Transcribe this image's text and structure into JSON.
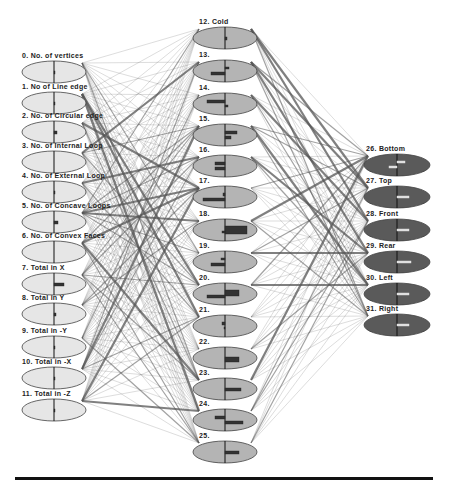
{
  "diagram": {
    "type": "neural-network",
    "colors": {
      "input_fill": "#e6e6e6",
      "hidden_fill": "#b4b4b4",
      "output_fill": "#5a5a5a",
      "node_stroke": "#444444",
      "edge": "#555555",
      "rule": "#111111"
    },
    "input_layer": [
      {
        "id": 0,
        "label": "0. No. of vertices",
        "cx": 54,
        "cy": 72,
        "bars": [
          {
            "w": 1,
            "h": 3,
            "dir": 1
          }
        ]
      },
      {
        "id": 1,
        "label": "1. No of Line edge",
        "cx": 54,
        "cy": 103,
        "bars": [
          {
            "w": 1,
            "h": 3,
            "dir": 1
          }
        ]
      },
      {
        "id": 2,
        "label": "2. No. of Circular edge",
        "cx": 54,
        "cy": 132,
        "bars": [
          {
            "w": 3,
            "h": 3,
            "dir": 1
          }
        ]
      },
      {
        "id": 3,
        "label": "3. No. of Internal Loop",
        "cx": 54,
        "cy": 162,
        "bars": []
      },
      {
        "id": 4,
        "label": "4. No. of External Loop",
        "cx": 54,
        "cy": 192,
        "bars": [
          {
            "w": 1,
            "h": 3,
            "dir": 1
          }
        ]
      },
      {
        "id": 5,
        "label": "5. No. of Concave Loops",
        "cx": 54,
        "cy": 222,
        "bars": [
          {
            "w": 4,
            "h": 3,
            "dir": 1
          }
        ]
      },
      {
        "id": 6,
        "label": "6. No. of Convex Faces",
        "cx": 54,
        "cy": 252,
        "bars": []
      },
      {
        "id": 7,
        "label": "7. Total in X",
        "cx": 54,
        "cy": 284,
        "bars": [
          {
            "w": 10,
            "h": 3,
            "dir": 1
          }
        ]
      },
      {
        "id": 8,
        "label": "8. Total in Y",
        "cx": 54,
        "cy": 314,
        "bars": [
          {
            "w": 2,
            "h": 3,
            "dir": 1
          }
        ]
      },
      {
        "id": 9,
        "label": "9. Total in -Y",
        "cx": 54,
        "cy": 347,
        "bars": [
          {
            "w": 1,
            "h": 3,
            "dir": 1
          }
        ]
      },
      {
        "id": 10,
        "label": "10. Total in -X",
        "cx": 54,
        "cy": 378,
        "bars": [
          {
            "w": 1,
            "h": 3,
            "dir": 1
          }
        ]
      },
      {
        "id": 11,
        "label": "11. Total in -Z",
        "cx": 54,
        "cy": 410,
        "bars": [
          {
            "w": 1,
            "h": 3,
            "dir": 1
          }
        ]
      }
    ],
    "hidden_layer": [
      {
        "id": 12,
        "label": "12. Cold",
        "cx": 225,
        "cy": 38,
        "bars": [
          {
            "w": 2,
            "h": 3,
            "dir": 1
          }
        ]
      },
      {
        "id": 13,
        "label": "13.",
        "cx": 225,
        "cy": 71,
        "bars": [
          {
            "w": 4,
            "h": 2,
            "dir": 1
          },
          {
            "w": 14,
            "h": 3,
            "dir": -1
          }
        ]
      },
      {
        "id": 14,
        "label": "14.",
        "cx": 225,
        "cy": 104,
        "bars": [
          {
            "w": 18,
            "h": 3,
            "dir": -1
          },
          {
            "w": 3,
            "h": 2,
            "dir": 1
          }
        ]
      },
      {
        "id": 15,
        "label": "15.",
        "cx": 225,
        "cy": 135,
        "bars": [
          {
            "w": 12,
            "h": 3,
            "dir": 1
          },
          {
            "w": 6,
            "h": 3,
            "dir": 1
          }
        ]
      },
      {
        "id": 16,
        "label": "16.",
        "cx": 225,
        "cy": 166,
        "bars": [
          {
            "w": 10,
            "h": 3,
            "dir": -1
          },
          {
            "w": 10,
            "h": 3,
            "dir": -1
          }
        ]
      },
      {
        "id": 17,
        "label": "17.",
        "cx": 225,
        "cy": 197,
        "bars": [
          {
            "w": 2,
            "h": 3,
            "dir": -1
          },
          {
            "w": 22,
            "h": 3,
            "dir": -1
          }
        ]
      },
      {
        "id": 18,
        "label": "18.",
        "cx": 225,
        "cy": 230,
        "bars": [
          {
            "w": 22,
            "h": 8,
            "dir": 1
          },
          {
            "w": 3,
            "h": 2,
            "dir": -1
          }
        ]
      },
      {
        "id": 19,
        "label": "19.",
        "cx": 225,
        "cy": 262,
        "bars": [
          {
            "w": 4,
            "h": 2,
            "dir": -1
          },
          {
            "w": 14,
            "h": 3,
            "dir": -1
          }
        ]
      },
      {
        "id": 20,
        "label": "20.",
        "cx": 225,
        "cy": 294,
        "bars": [
          {
            "w": 14,
            "h": 6,
            "dir": 1
          },
          {
            "w": 18,
            "h": 3,
            "dir": -1
          }
        ]
      },
      {
        "id": 21,
        "label": "21.",
        "cx": 225,
        "cy": 326,
        "bars": [
          {
            "w": 3,
            "h": 3,
            "dir": -1
          },
          {
            "w": 1,
            "h": 2,
            "dir": -1
          }
        ]
      },
      {
        "id": 22,
        "label": "22.",
        "cx": 225,
        "cy": 358,
        "bars": [
          {
            "w": 14,
            "h": 5,
            "dir": 1
          }
        ]
      },
      {
        "id": 23,
        "label": "23.",
        "cx": 225,
        "cy": 389,
        "bars": [
          {
            "w": 16,
            "h": 3,
            "dir": 1
          }
        ]
      },
      {
        "id": 24,
        "label": "24.",
        "cx": 225,
        "cy": 420,
        "bars": [
          {
            "w": 10,
            "h": 3,
            "dir": -1
          },
          {
            "w": 18,
            "h": 3,
            "dir": 1
          }
        ]
      },
      {
        "id": 25,
        "label": "25.",
        "cx": 225,
        "cy": 452,
        "bars": [
          {
            "w": 14,
            "h": 3,
            "dir": 1
          }
        ]
      }
    ],
    "output_layer": [
      {
        "id": 26,
        "label": "26. Bottom",
        "cx": 397,
        "cy": 165,
        "bars": [
          {
            "w": 8,
            "h": 2,
            "dir": 1
          },
          {
            "w": 8,
            "h": 2,
            "dir": -1
          }
        ]
      },
      {
        "id": 27,
        "label": "27. Top",
        "cx": 397,
        "cy": 197,
        "bars": [
          {
            "w": 12,
            "h": 2,
            "dir": 1
          }
        ]
      },
      {
        "id": 28,
        "label": "28. Front",
        "cx": 397,
        "cy": 230,
        "bars": [
          {
            "w": 12,
            "h": 2,
            "dir": 1
          }
        ]
      },
      {
        "id": 29,
        "label": "29. Rear",
        "cx": 397,
        "cy": 262,
        "bars": [
          {
            "w": 14,
            "h": 2,
            "dir": 1
          }
        ]
      },
      {
        "id": 30,
        "label": "30. Left",
        "cx": 397,
        "cy": 294,
        "bars": [
          {
            "w": 12,
            "h": 2,
            "dir": 1
          }
        ]
      },
      {
        "id": 31,
        "label": "31. Right",
        "cx": 397,
        "cy": 325,
        "bars": [
          {
            "w": 12,
            "h": 2,
            "dir": 1
          }
        ]
      }
    ],
    "node_size": {
      "input_rx": 32,
      "input_ry": 11,
      "hidden_rx": 32,
      "hidden_ry": 11,
      "output_rx": 33,
      "output_ry": 11
    }
  }
}
